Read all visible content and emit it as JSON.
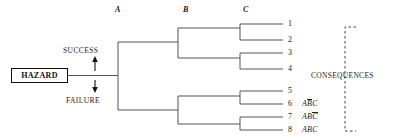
{
  "diagram": {
    "title_hazard": "HAZARD",
    "column_headers": [
      {
        "label": "A",
        "x": 115,
        "y": 7
      },
      {
        "label": "B",
        "x": 183,
        "y": 7
      },
      {
        "label": "C",
        "x": 243,
        "y": 7
      }
    ],
    "branch_labels": [
      {
        "label": "SUCCESS",
        "x": 63,
        "y": 52
      },
      {
        "label": "FAILURE",
        "x": 66,
        "y": 94
      }
    ],
    "consequences_label": "CONSEQUENCES",
    "outcomes": [
      {
        "number": "1",
        "expr_pre": "",
        "expr_bar": "",
        "expr_post": "",
        "full": "1"
      },
      {
        "number": "2",
        "expr_pre": "",
        "expr_bar": "",
        "expr_post": "",
        "full": "2"
      },
      {
        "number": "3",
        "expr_pre": "",
        "expr_bar": "",
        "expr_post": "",
        "full": "3"
      },
      {
        "number": "4",
        "expr_pre": "",
        "expr_bar": "",
        "expr_post": "",
        "full": "4"
      },
      {
        "number": "5",
        "expr_pre": "",
        "expr_bar": "",
        "expr_post": "",
        "full": "5"
      },
      {
        "number": "6",
        "expr_pre": "A",
        "expr_bar": "B",
        "expr_post": "C",
        "full": "6  AB̅C"
      },
      {
        "number": "7",
        "expr_pre": "AB",
        "expr_bar": "C",
        "expr_post": "",
        "full": "7  ABC̅"
      },
      {
        "number": "8",
        "expr_pre": "ABC",
        "expr_bar": "",
        "expr_post": "",
        "full": "8  ABC"
      }
    ]
  },
  "colors": {
    "line": "#555555",
    "ink": "#1a1a1a",
    "dashed": "#444444",
    "background": "#ffffff"
  }
}
